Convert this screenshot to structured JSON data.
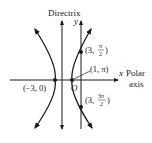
{
  "diagram": {
    "labels": {
      "directrix": "Directrix",
      "y_axis": "y",
      "x_axis": "x",
      "polar_axis_line1": "Polar",
      "polar_axis_line2": "axis",
      "origin": "O"
    },
    "points": [
      {
        "id": "vertex-left",
        "label": "(−3, 0)"
      },
      {
        "id": "point-1-pi",
        "label": "(1, π)"
      },
      {
        "id": "point-3-pi-2",
        "label_prefix": "(3, ",
        "num": "π",
        "den": "2",
        "suffix": ")"
      },
      {
        "id": "point-3-3pi-2",
        "label_prefix": "(3, ",
        "num": "3π",
        "den": "2",
        "suffix": ")"
      }
    ],
    "colors": {
      "stroke": "#1a1a1a",
      "text": "#222222",
      "background": "#ffffff"
    }
  }
}
